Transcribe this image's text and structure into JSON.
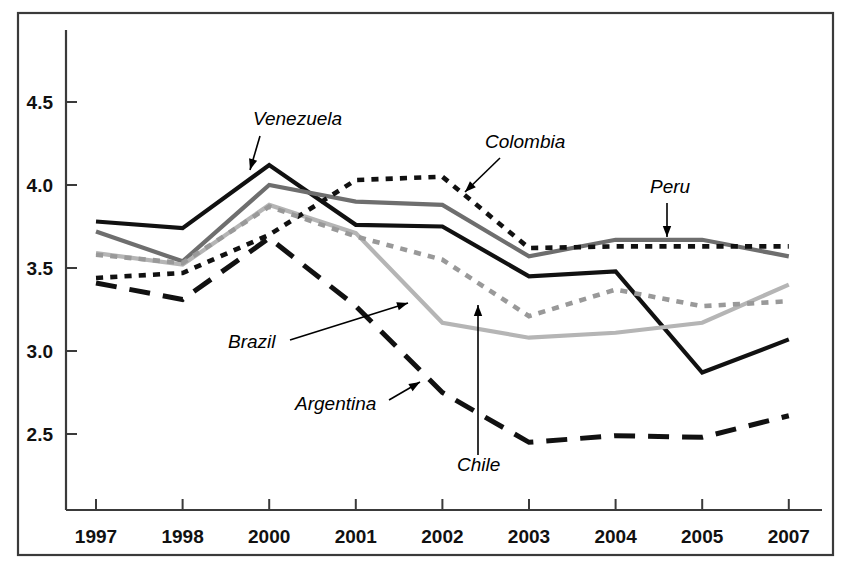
{
  "chart_data": {
    "type": "line",
    "title": "",
    "subtitle": "",
    "xlabel": "",
    "ylabel": "",
    "grid": false,
    "legend_position": "inline-annotations",
    "x": [
      "1997",
      "1998",
      "2000",
      "2001",
      "2002",
      "2003",
      "2004",
      "2005",
      "2007"
    ],
    "categories": [
      "1997",
      "1998",
      "2000",
      "2001",
      "2002",
      "2003",
      "2004",
      "2005",
      "2007"
    ],
    "xtick_labels": [
      "1997",
      "1998",
      "2000",
      "2001",
      "2002",
      "2003",
      "2004",
      "2005",
      "2007"
    ],
    "ytick_labels": [
      "2.5",
      "3.0",
      "3.5",
      "4.0",
      "4.5"
    ],
    "ytick_values": [
      2.5,
      3.0,
      3.5,
      4.0,
      4.5
    ],
    "ylim": [
      2.1,
      4.75
    ],
    "xlim": [
      0,
      8
    ],
    "series": [
      {
        "name": "Venezuela",
        "style": "solid",
        "color": "#111111",
        "width": 4.2,
        "values": [
          3.78,
          3.74,
          4.12,
          3.76,
          3.75,
          3.45,
          3.48,
          2.87,
          3.07
        ]
      },
      {
        "name": "Peru",
        "style": "solid",
        "color": "#6e6e6e",
        "width": 4.2,
        "values": [
          3.72,
          3.54,
          4.0,
          3.9,
          3.88,
          3.57,
          3.67,
          3.67,
          3.57
        ]
      },
      {
        "name": "Chile",
        "style": "solid",
        "color": "#b5b5b5",
        "width": 4.2,
        "values": [
          3.59,
          3.52,
          3.88,
          3.71,
          3.17,
          3.08,
          3.11,
          3.17,
          3.4
        ]
      },
      {
        "name": "Colombia",
        "style": "dotted",
        "color": "#111111",
        "width": 4.6,
        "values": [
          3.44,
          3.47,
          3.7,
          4.03,
          4.05,
          3.62,
          3.63,
          3.63,
          3.63
        ]
      },
      {
        "name": "Brazil",
        "style": "dotted",
        "color": "#999999",
        "width": 4.6,
        "values": [
          3.58,
          3.53,
          3.87,
          3.69,
          3.55,
          3.21,
          3.37,
          3.27,
          3.3
        ]
      },
      {
        "name": "Argentina",
        "style": "dashed",
        "color": "#111111",
        "width": 5.0,
        "values": [
          3.41,
          3.31,
          3.68,
          3.27,
          2.75,
          2.45,
          2.49,
          2.48,
          2.61
        ]
      }
    ],
    "annotations": [
      {
        "label": "Venezuela",
        "text_x": 253,
        "text_y": 125,
        "arrow_from_x": 260,
        "arrow_from_y": 136,
        "arrow_to_x": 250,
        "arrow_to_y": 170
      },
      {
        "label": "Colombia",
        "text_x": 485,
        "text_y": 148,
        "arrow_from_x": 500,
        "arrow_from_y": 158,
        "arrow_to_x": 465,
        "arrow_to_y": 192
      },
      {
        "label": "Peru",
        "text_x": 650,
        "text_y": 193,
        "arrow_from_x": 667,
        "arrow_from_y": 203,
        "arrow_to_x": 667,
        "arrow_to_y": 237
      },
      {
        "label": "Brazil",
        "text_x": 228,
        "text_y": 348,
        "arrow_from_x": 290,
        "arrow_from_y": 340,
        "arrow_to_x": 408,
        "arrow_to_y": 303
      },
      {
        "label": "Argentina",
        "text_x": 295,
        "text_y": 410,
        "arrow_from_x": 389,
        "arrow_from_y": 400,
        "arrow_to_x": 420,
        "arrow_to_y": 382
      },
      {
        "label": "Chile",
        "text_x": 457,
        "text_y": 471,
        "arrow_from_x": 478,
        "arrow_from_y": 455,
        "arrow_to_x": 478,
        "arrow_to_y": 305
      }
    ]
  },
  "axes": {
    "x_ticks": [
      "1997",
      "1998",
      "2000",
      "2001",
      "2002",
      "2003",
      "2004",
      "2005",
      "2007"
    ],
    "y_ticks": [
      "4.5",
      "4.0",
      "3.5",
      "3.0",
      "2.5"
    ]
  },
  "colors": {
    "series_dark": "#111111",
    "series_mid_gray": "#6e6e6e",
    "series_light_gray": "#b5b5b5",
    "series_dot_gray": "#999999",
    "axis": "#3a3a3a",
    "background": "#ffffff"
  }
}
